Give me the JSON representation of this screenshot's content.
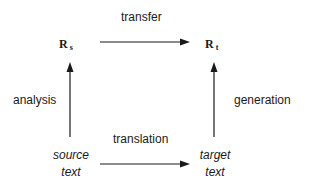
{
  "diagram": {
    "nodes": {
      "rs": {
        "base": "R",
        "sub": "s"
      },
      "rt": {
        "base": "R",
        "sub": "t"
      },
      "source": {
        "line1": "source",
        "line2": "text"
      },
      "target": {
        "line1": "target",
        "line2": "text"
      }
    },
    "edges": {
      "transfer": {
        "label": "transfer",
        "from": "rs",
        "to": "rt"
      },
      "analysis": {
        "label": "analysis",
        "from": "source",
        "to": "rs"
      },
      "generation": {
        "label": "generation",
        "from": "target",
        "to": "rt"
      },
      "translation": {
        "label": "translation",
        "from": "source",
        "to": "target"
      }
    },
    "colors": {
      "stroke": "#1a1a1a",
      "background": "#ffffff"
    }
  }
}
